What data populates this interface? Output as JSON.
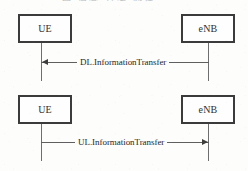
{
  "caption": {
    "text": "图 信息 传递 流程",
    "note": "clipped-top-caption"
  },
  "diagram": {
    "type": "uml-sequence-diagram",
    "colors": {
      "background": "#fdfdfb",
      "box_border": "#3b3b3b",
      "lifeline": "#6e6e6e",
      "arrow": "#3d3d3d",
      "text": "#272727"
    },
    "panels": [
      {
        "id": "downlink",
        "participants": [
          {
            "id": "ue-1",
            "label": "UE"
          },
          {
            "id": "enb-1",
            "label": "eNB"
          }
        ],
        "message": {
          "label": "DL.InformationTransfer",
          "from": "eNB",
          "to": "UE",
          "direction": "left"
        }
      },
      {
        "id": "uplink",
        "participants": [
          {
            "id": "ue-2",
            "label": "UE"
          },
          {
            "id": "enb-2",
            "label": "eNB"
          }
        ],
        "message": {
          "label": "UL.InformationTransfer",
          "from": "UE",
          "to": "eNB",
          "direction": "right"
        }
      }
    ]
  }
}
